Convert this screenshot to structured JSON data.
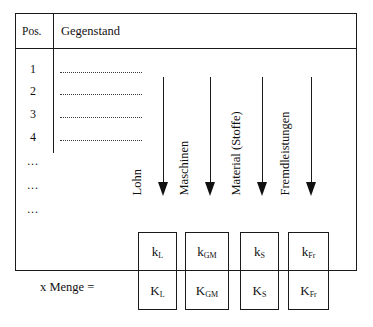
{
  "figure": {
    "table": {
      "headers": [
        "Pos.",
        "Gegenstand"
      ],
      "rows": [
        {
          "pos": "1",
          "gegenstand": ""
        },
        {
          "pos": "2",
          "gegenstand": ""
        },
        {
          "pos": "3",
          "gegenstand": ""
        },
        {
          "pos": "4",
          "gegenstand": ""
        }
      ],
      "continuation_rows": [
        "...",
        "...",
        "..."
      ]
    },
    "cost_categories": [
      {
        "label": "Lohn",
        "unit_cost": "k",
        "unit_sub": "L",
        "total_cost": "K",
        "total_sub": "L"
      },
      {
        "label": "Maschinen",
        "unit_cost": "k",
        "unit_sub": "GM",
        "total_cost": "K",
        "total_sub": "GM"
      },
      {
        "label": "Material (Stoffe)",
        "unit_cost": "k",
        "unit_sub": "S",
        "total_cost": "K",
        "total_sub": "S"
      },
      {
        "label": "Fremdleistungen",
        "unit_cost": "k",
        "unit_sub": "Fr",
        "total_cost": "K",
        "total_sub": "Fr"
      }
    ],
    "multiplier_label": "x Menge =",
    "colors": {
      "line": "#1a1a1a",
      "text": "#111111",
      "background": "#ffffff"
    }
  }
}
